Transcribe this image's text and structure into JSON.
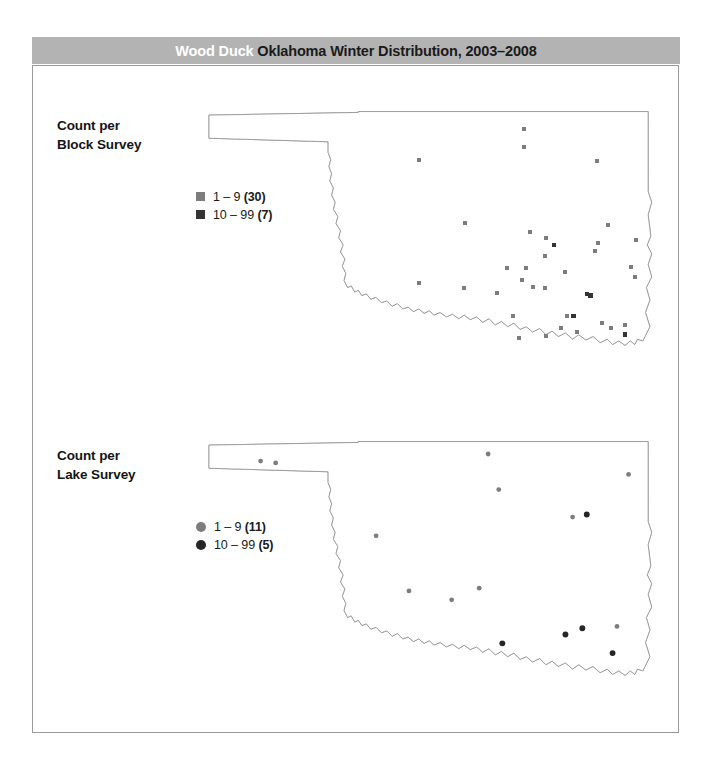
{
  "title": {
    "species": "Wood Duck ",
    "rest": "Oklahoma Winter Distribution, 2003–2008",
    "bar_color": "#b3b3b3",
    "species_color": "#ffffff",
    "rest_color": "#1a1a1a"
  },
  "panels": [
    {
      "id": "block",
      "label_line1": "Count per",
      "label_line2": "Block Survey",
      "marker_shape": "square",
      "legend": [
        {
          "swatch_color": "#7d7d7d",
          "range": "1 – 9 ",
          "count": "(30)"
        },
        {
          "swatch_color": "#333333",
          "range": "10 – 99 ",
          "count": "(7)"
        }
      ]
    },
    {
      "id": "lake",
      "label_line1": "Count per",
      "label_line2": "Lake Survey",
      "marker_shape": "circle",
      "legend": [
        {
          "swatch_color": "#7d7d7d",
          "range": "1 – 9 ",
          "count": "(11)"
        },
        {
          "swatch_color": "#262626",
          "range": "10 – 99 ",
          "count": "(5)"
        }
      ]
    }
  ],
  "chart_data": {
    "type": "map",
    "title": "Wood Duck Oklahoma Winter Distribution, 2003–2008",
    "region": "Oklahoma",
    "projection_note": "county outline map, panhandle at upper left",
    "maps": [
      {
        "name": "Count per Block Survey",
        "marker_shape": "square",
        "classes": [
          {
            "label": "1 – 9",
            "count": 30,
            "color": "#7d7d7d"
          },
          {
            "label": "10 – 99",
            "count": 7,
            "color": "#333333"
          }
        ],
        "points": [
          {
            "x": 372,
            "y": 30,
            "class": 0
          },
          {
            "x": 372,
            "y": 50,
            "class": 0
          },
          {
            "x": 254,
            "y": 64,
            "class": 0
          },
          {
            "x": 455,
            "y": 66,
            "class": 0
          },
          {
            "x": 306,
            "y": 135,
            "class": 0
          },
          {
            "x": 379,
            "y": 145,
            "class": 0
          },
          {
            "x": 397,
            "y": 152,
            "class": 0
          },
          {
            "x": 406,
            "y": 160,
            "class": 1
          },
          {
            "x": 396,
            "y": 172,
            "class": 0
          },
          {
            "x": 467,
            "y": 138,
            "class": 0
          },
          {
            "x": 456,
            "y": 158,
            "class": 0
          },
          {
            "x": 452,
            "y": 167,
            "class": 0
          },
          {
            "x": 375,
            "y": 186,
            "class": 0
          },
          {
            "x": 353,
            "y": 186,
            "class": 0
          },
          {
            "x": 370,
            "y": 200,
            "class": 0
          },
          {
            "x": 418,
            "y": 190,
            "class": 0
          },
          {
            "x": 254,
            "y": 203,
            "class": 0
          },
          {
            "x": 305,
            "y": 208,
            "class": 0
          },
          {
            "x": 342,
            "y": 214,
            "class": 0
          },
          {
            "x": 382,
            "y": 207,
            "class": 0
          },
          {
            "x": 396,
            "y": 208,
            "class": 0
          },
          {
            "x": 443,
            "y": 215,
            "class": 1
          },
          {
            "x": 447,
            "y": 217,
            "class": 1
          },
          {
            "x": 360,
            "y": 240,
            "class": 0
          },
          {
            "x": 421,
            "y": 240,
            "class": 0
          },
          {
            "x": 428,
            "y": 240,
            "class": 1
          },
          {
            "x": 414,
            "y": 253,
            "class": 0
          },
          {
            "x": 460,
            "y": 248,
            "class": 0
          },
          {
            "x": 470,
            "y": 253,
            "class": 0
          },
          {
            "x": 367,
            "y": 265,
            "class": 0
          },
          {
            "x": 397,
            "y": 263,
            "class": 0
          },
          {
            "x": 432,
            "y": 258,
            "class": 0
          },
          {
            "x": 486,
            "y": 250,
            "class": 0
          },
          {
            "x": 486,
            "y": 261,
            "class": 1
          },
          {
            "x": 498,
            "y": 155,
            "class": 0
          },
          {
            "x": 493,
            "y": 185,
            "class": 0
          },
          {
            "x": 497,
            "y": 196,
            "class": 0
          }
        ]
      },
      {
        "name": "Count per Lake Survey",
        "marker_shape": "circle",
        "classes": [
          {
            "label": "1 – 9",
            "count": 11,
            "color": "#7d7d7d"
          },
          {
            "label": "10 – 99",
            "count": 5,
            "color": "#262626"
          }
        ],
        "points": [
          {
            "x": 76,
            "y": 32,
            "class": 0
          },
          {
            "x": 93,
            "y": 34,
            "class": 0
          },
          {
            "x": 332,
            "y": 24,
            "class": 0
          },
          {
            "x": 344,
            "y": 64,
            "class": 0
          },
          {
            "x": 490,
            "y": 47,
            "class": 0
          },
          {
            "x": 427,
            "y": 95,
            "class": 0
          },
          {
            "x": 443,
            "y": 92,
            "class": 1
          },
          {
            "x": 206,
            "y": 116,
            "class": 0
          },
          {
            "x": 243,
            "y": 178,
            "class": 0
          },
          {
            "x": 291,
            "y": 188,
            "class": 0
          },
          {
            "x": 322,
            "y": 175,
            "class": 0
          },
          {
            "x": 348,
            "y": 237,
            "class": 1
          },
          {
            "x": 419,
            "y": 227,
            "class": 1
          },
          {
            "x": 438,
            "y": 220,
            "class": 1
          },
          {
            "x": 477,
            "y": 218,
            "class": 0
          },
          {
            "x": 472,
            "y": 248,
            "class": 1
          }
        ]
      }
    ]
  }
}
